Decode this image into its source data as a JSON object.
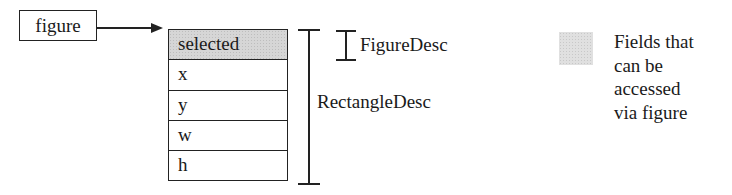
{
  "pointer": {
    "label": "figure"
  },
  "struct": {
    "fields": [
      {
        "name": "selected",
        "accessible": true
      },
      {
        "name": "x",
        "accessible": false
      },
      {
        "name": "y",
        "accessible": false
      },
      {
        "name": "w",
        "accessible": false
      },
      {
        "name": "h",
        "accessible": false
      }
    ]
  },
  "brackets": {
    "figure_desc": "FigureDesc",
    "rectangle_desc": "RectangleDesc"
  },
  "legend": {
    "lines": [
      "Fields that",
      "can be",
      "accessed",
      "via figure"
    ],
    "swatch_color": "#e0e0e0"
  },
  "colors": {
    "line": "#222222",
    "accessible_fill": "#d6d6d6",
    "background": "#ffffff"
  }
}
